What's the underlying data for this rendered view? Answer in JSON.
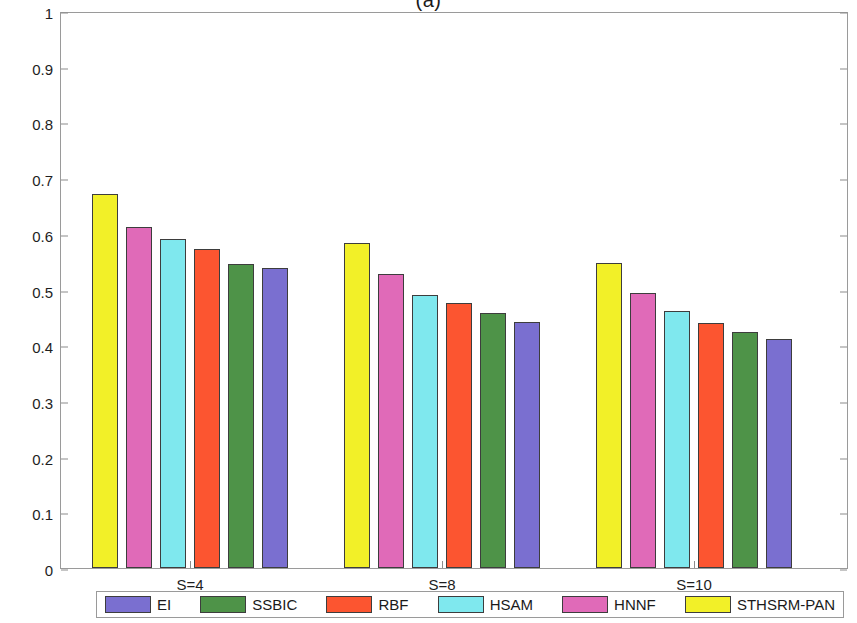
{
  "chart_data": {
    "type": "bar",
    "title": "(a)",
    "xlabel": "",
    "ylabel": "Kappa",
    "ylim": [
      0,
      1
    ],
    "yticks": [
      "0",
      "0.1",
      "0.2",
      "0.3",
      "0.4",
      "0.5",
      "0.6",
      "0.7",
      "0.8",
      "0.9",
      "1"
    ],
    "ytick_values": [
      0,
      0.1,
      0.2,
      0.3,
      0.4,
      0.5,
      0.6,
      0.7,
      0.8,
      0.9,
      1
    ],
    "grid": false,
    "legend_position": "bottom-outside",
    "categories": [
      "S=4",
      "S=8",
      "S=10"
    ],
    "series": [
      {
        "name": "EI",
        "color": "#7a6fd0",
        "values": [
          0.538,
          0.442,
          0.412
        ]
      },
      {
        "name": "SSBIC",
        "color": "#4e9348",
        "values": [
          0.545,
          0.457,
          0.423
        ]
      },
      {
        "name": "RBF",
        "color": "#fc5530",
        "values": [
          0.573,
          0.476,
          0.44
        ]
      },
      {
        "name": "HSAM",
        "color": "#7fe8ee",
        "values": [
          0.59,
          0.491,
          0.462
        ]
      },
      {
        "name": "HNNF",
        "color": "#e06ab8",
        "values": [
          0.613,
          0.527,
          0.494
        ]
      },
      {
        "name": "STHSRM-PAN",
        "color": "#f2f028",
        "values": [
          0.671,
          0.584,
          0.548
        ]
      }
    ],
    "bar_draw_order": [
      "STHSRM-PAN",
      "HNNF",
      "HSAM",
      "RBF",
      "SSBIC",
      "EI"
    ],
    "legend_order": [
      "EI",
      "SSBIC",
      "RBF",
      "HSAM",
      "HNNF",
      "STHSRM-PAN"
    ]
  },
  "colors": {
    "axis": "#9a9a9a",
    "tick": "#8c8c8c",
    "text": "#1e1e1e",
    "bar_edge": "#3d3d3d",
    "background": "#ffffff"
  }
}
